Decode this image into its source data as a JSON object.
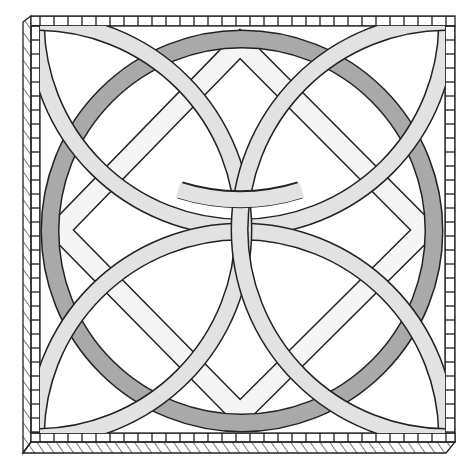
{
  "colors": {
    "background": "#ffffff",
    "outline": "#222222",
    "ring": "#a9a9a9",
    "arcs": "#e2e2e2",
    "diamond": "#f5f5f5",
    "frame": "#ffffff"
  },
  "elements": {
    "frame": "square-frame",
    "ring": "circle-ring",
    "diamond": "rotated-square",
    "arcs": [
      "top-arc",
      "bottom-arc",
      "left-arc",
      "right-arc"
    ]
  }
}
